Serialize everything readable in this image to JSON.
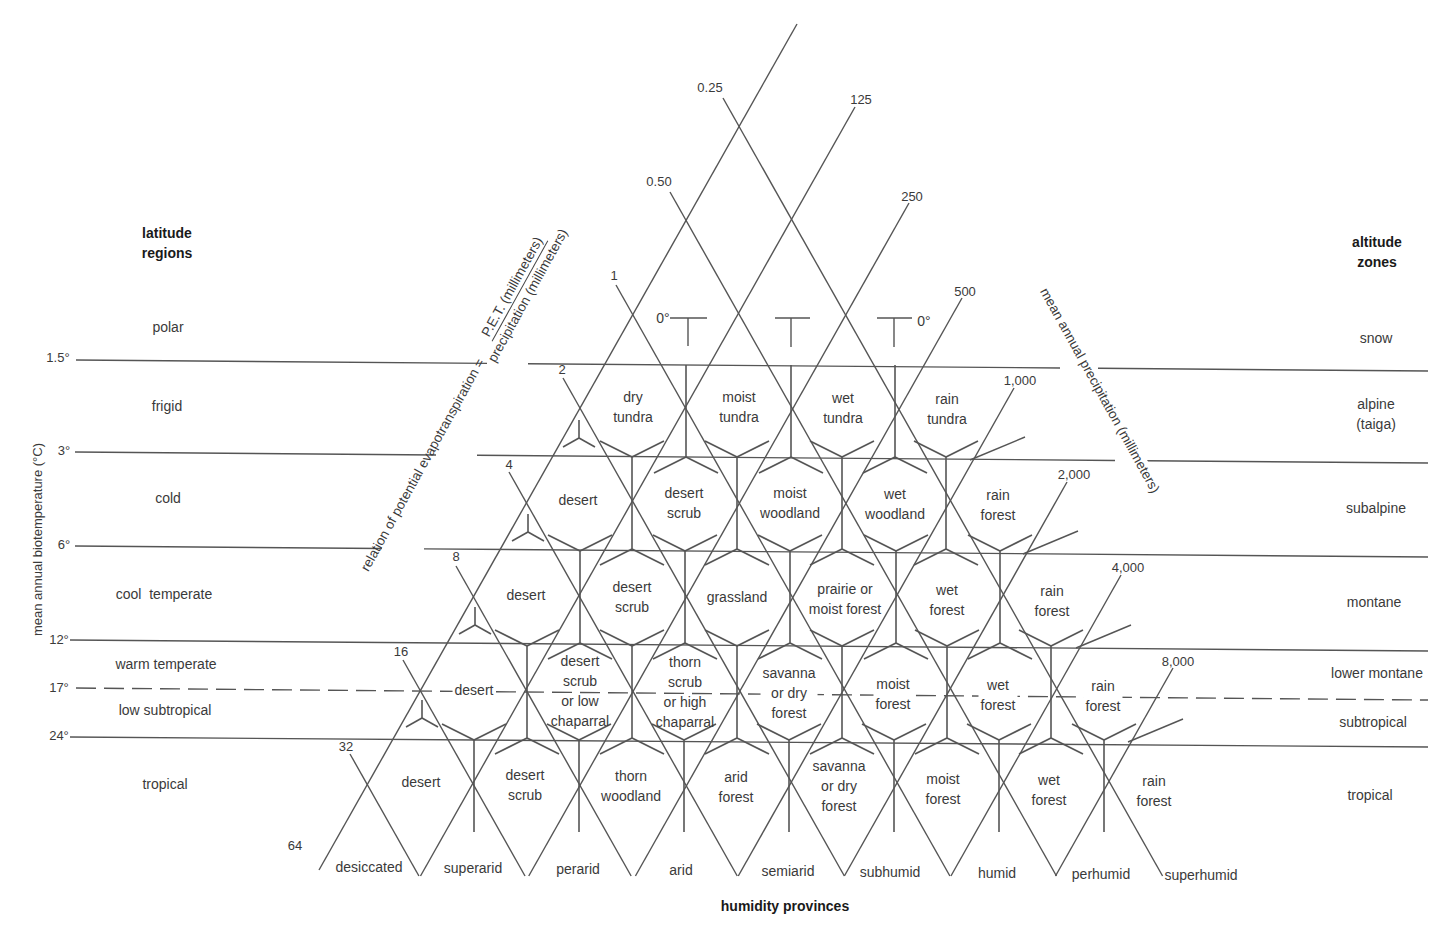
{
  "headers": {
    "latitude": "latitude\nregions",
    "altitude": "altitude\nzones",
    "humidity": "humidity provinces"
  },
  "axes": {
    "left": "mean annual biotemperature (°C)",
    "pet_prefix": "relation of potential evapotranspiration =",
    "pet_numerator": "P.E.T. (millimeters)",
    "pet_denominator": "precipitation (millimeters)",
    "precip": "mean annual precipitation (millimeters)"
  },
  "temperature_ticks": [
    "1.5°",
    "3°",
    "6°",
    "12°",
    "17°",
    "24°"
  ],
  "frost_labels": [
    "0°",
    "0°"
  ],
  "latitude_regions": [
    "polar",
    "frigid",
    "cold",
    "cool  temperate",
    "warm temperate",
    "low subtropical",
    "tropical"
  ],
  "altitude_zones": [
    "snow",
    "alpine\n(taiga)",
    "subalpine",
    "montane",
    "lower montane",
    "subtropical",
    "tropical"
  ],
  "pet_ratio_ticks": [
    "0.25",
    "0.50",
    "1",
    "2",
    "4",
    "8",
    "16",
    "32",
    "64"
  ],
  "precip_ticks": [
    "125",
    "250",
    "500",
    "1,000",
    "2,000",
    "4,000",
    "8,000"
  ],
  "humidity_provinces": [
    "desiccated",
    "superarid",
    "perarid",
    "arid",
    "semiarid",
    "subhumid",
    "humid",
    "perhumid",
    "superhumid"
  ],
  "life_zones": {
    "polar_subpolar": [
      "dry\ntundra",
      "moist\ntundra",
      "wet\ntundra",
      "rain\ntundra"
    ],
    "boreal": [
      "desert",
      "desert\nscrub",
      "moist\nwoodland",
      "wet\nwoodland",
      "rain\nforest"
    ],
    "cool_temperate": [
      "desert",
      "desert\nscrub",
      "grassland",
      "prairie or\nmoist forest",
      "wet\nforest",
      "rain\nforest"
    ],
    "warm_temperate_subtropical": [
      "desert",
      "desert\nscrub\nor low\nchaparral",
      "thorn\nscrub\nor high\nchaparral",
      "savanna\nor dry\nforest",
      "moist\nforest",
      "wet\nforest",
      "rain\nforest"
    ],
    "tropical": [
      "desert",
      "desert\nscrub",
      "thorn\nwoodland",
      "arid\nforest",
      "savanna\nor dry\nforest",
      "moist\nforest",
      "wet\nforest",
      "rain\nforest"
    ]
  }
}
